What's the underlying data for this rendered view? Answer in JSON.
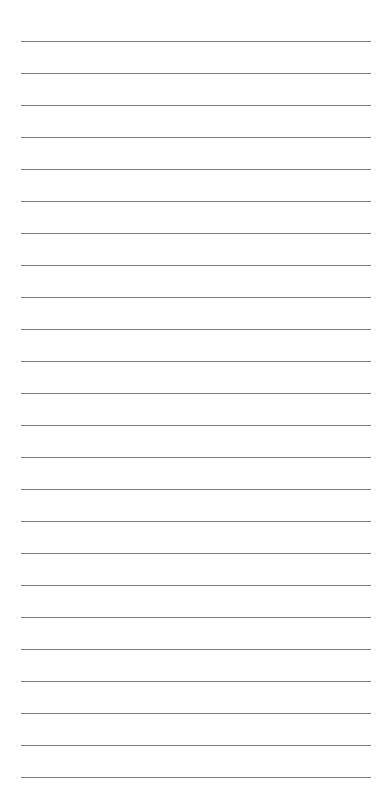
{
  "page": {
    "type": "lined-paper",
    "background_color": "#ffffff",
    "line_color": "#7a7a7a",
    "line_count": 24,
    "first_line_y": 41,
    "line_spacing": 32,
    "line_left": 21,
    "line_width": 350,
    "lines": [
      "",
      "",
      "",
      "",
      "",
      "",
      "",
      "",
      "",
      "",
      "",
      "",
      "",
      "",
      "",
      "",
      "",
      "",
      "",
      "",
      "",
      "",
      "",
      ""
    ]
  }
}
